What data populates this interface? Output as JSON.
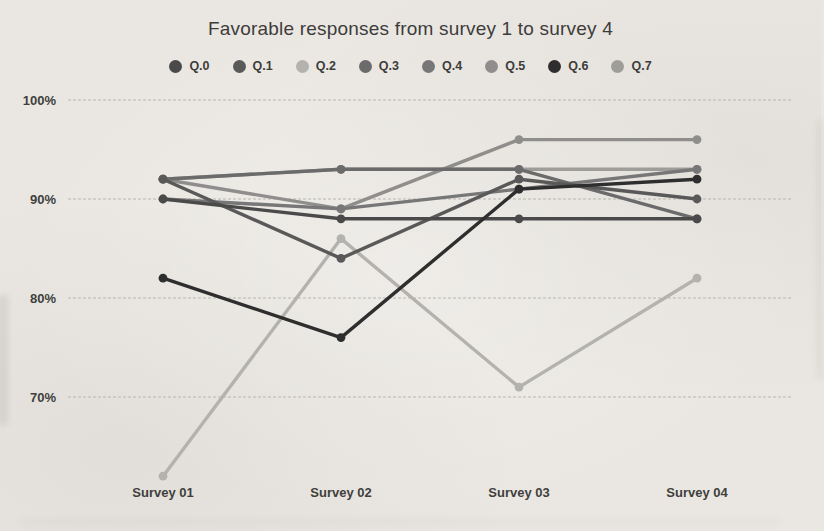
{
  "chart_data": {
    "type": "line",
    "title": "Favorable responses from survey 1 to survey 4",
    "categories": [
      "Survey 01",
      "Survey 02",
      "Survey 03",
      "Survey 04"
    ],
    "series": [
      {
        "name": "Q.0",
        "color": "#4a4a4a",
        "values": [
          90,
          88,
          88,
          88
        ]
      },
      {
        "name": "Q.1",
        "color": "#595959",
        "values": [
          92,
          84,
          92,
          90
        ]
      },
      {
        "name": "Q.2",
        "color": "#b4b2ae",
        "values": [
          62,
          86,
          71,
          82
        ]
      },
      {
        "name": "Q.3",
        "color": "#6b6b6b",
        "values": [
          92,
          93,
          93,
          88
        ]
      },
      {
        "name": "Q.4",
        "color": "#777777",
        "values": [
          90,
          89,
          91,
          93
        ]
      },
      {
        "name": "Q.5",
        "color": "#8f8e8c",
        "values": [
          92,
          89,
          96,
          96
        ]
      },
      {
        "name": "Q.6",
        "color": "#2e2e2e",
        "values": [
          82,
          76,
          91,
          92
        ]
      },
      {
        "name": "Q.7",
        "color": "#9f9d9a",
        "values": [
          92,
          93,
          93,
          93
        ]
      }
    ],
    "yticks": [
      {
        "label": "100%",
        "value": 100
      },
      {
        "label": "90%",
        "value": 90
      },
      {
        "label": "80%",
        "value": 80
      },
      {
        "label": "70%",
        "value": 70
      }
    ],
    "ylim": [
      60,
      101
    ],
    "grid": true,
    "legend_position": "top",
    "marker": "circle"
  }
}
